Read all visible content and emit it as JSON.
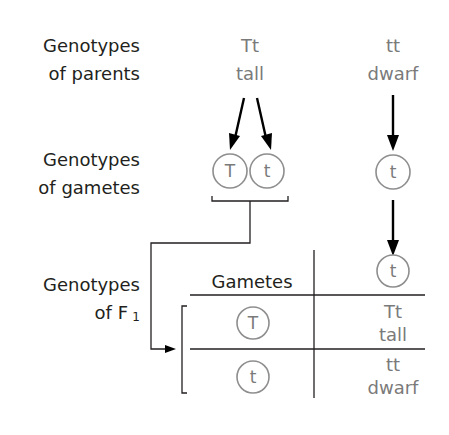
{
  "diagram": {
    "type": "monohybrid test cross",
    "row_labels": {
      "parents": [
        "Genotypes",
        "of parents"
      ],
      "gametes": [
        "Genotypes",
        "of gametes"
      ],
      "f1": [
        "Genotypes",
        "of F",
        "1"
      ]
    },
    "parent1": {
      "genotype": "Tt",
      "phenotype": "tall"
    },
    "parent2": {
      "genotype": "tt",
      "phenotype": "dwarf"
    },
    "parent1_gametes": [
      "T",
      "t"
    ],
    "parent2_gametes": [
      "t"
    ],
    "table": {
      "header": "Gametes",
      "column_gamete": "t",
      "rows": [
        {
          "gamete": "T",
          "genotype": "Tt",
          "phenotype": "tall"
        },
        {
          "gamete": "t",
          "genotype": "tt",
          "phenotype": "dwarf"
        }
      ]
    },
    "colors": {
      "label": "#231f20",
      "genotype_text": "#7a7a7a",
      "circle_stroke": "#8e8e8e",
      "arrow": "#000000"
    }
  }
}
